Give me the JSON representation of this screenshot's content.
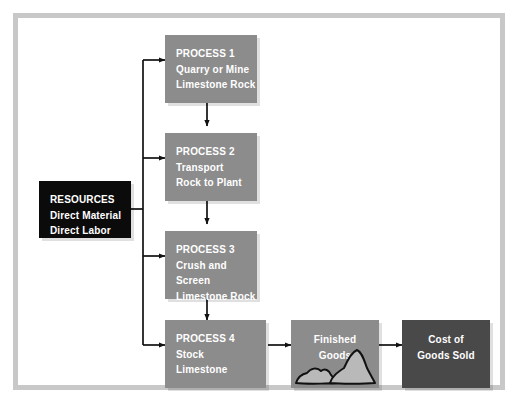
{
  "diagram": {
    "colors": {
      "frame": "#c8c8c8",
      "process_box": "#8c8c8c",
      "resources_box": "#0b0b0b",
      "finished_goods_box": "#8c8c8c",
      "cost_of_goods_sold_box": "#494949",
      "connector": "#111111",
      "text": "#ffffff",
      "rock_fill": "#b9b9b9",
      "rock_outline": "#111111",
      "background": "#ffffff"
    },
    "resources": {
      "heading": "RESOURCES",
      "items": [
        "Direct Material",
        "Direct Labor",
        "Overhead"
      ],
      "text": "RESOURCES\nDirect Material\nDirect Labor\nOverhead"
    },
    "processes": [
      {
        "id": "process-1",
        "heading": "PROCESS 1",
        "lines": [
          "Quarry or Mine",
          "Limestone Rock"
        ],
        "text": "PROCESS 1\nQuarry or Mine\nLimestone Rock"
      },
      {
        "id": "process-2",
        "heading": "PROCESS 2",
        "lines": [
          "Transport",
          "Rock to Plant"
        ],
        "text": "PROCESS 2\nTransport\nRock to Plant"
      },
      {
        "id": "process-3",
        "heading": "PROCESS 3",
        "lines": [
          "Crush and Screen",
          "Limestone Rock"
        ],
        "text": "PROCESS 3\nCrush and Screen\nLimestone Rock"
      },
      {
        "id": "process-4",
        "heading": "PROCESS 4",
        "lines": [
          "Stock",
          "Limestone"
        ],
        "text": "PROCESS 4\nStock\nLimestone"
      }
    ],
    "outputs": [
      {
        "id": "finished-goods",
        "text": "Finished\nGoods",
        "graphic": "rock-pile-icon"
      },
      {
        "id": "cost-of-goods-sold",
        "text": "Cost of\nGoods Sold",
        "graphic": null
      }
    ]
  }
}
